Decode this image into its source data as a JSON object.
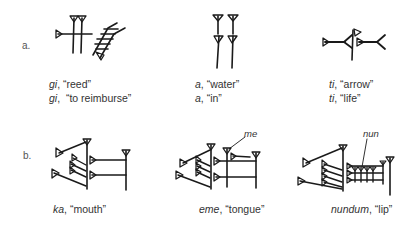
{
  "rows": [
    {
      "label": "a.",
      "signs": [
        {
          "glyph": "gi-sign",
          "captions": [
            {
              "translit": "gi",
              "sep": ", ",
              "gloss": "“reed”"
            },
            {
              "translit": "gi",
              "sep": ",  ",
              "gloss": "“to reimburse”"
            }
          ]
        },
        {
          "glyph": "a-sign",
          "captions": [
            {
              "translit": "a",
              "sep": ", ",
              "gloss": "“water”"
            },
            {
              "translit": "a",
              "sep": ", ",
              "gloss": "“in”"
            }
          ]
        },
        {
          "glyph": "ti-sign",
          "captions": [
            {
              "translit": "ti",
              "sep": ", ",
              "gloss": "“arrow”"
            },
            {
              "translit": "ti",
              "sep": ", ",
              "gloss": "“life”"
            }
          ]
        }
      ]
    },
    {
      "label": "b.",
      "signs": [
        {
          "glyph": "ka-sign",
          "captions": [
            {
              "translit": "ka",
              "sep": ", ",
              "gloss": "“mouth”"
            }
          ]
        },
        {
          "glyph": "eme-sign",
          "annotation": "me",
          "captions": [
            {
              "translit": "eme",
              "sep": ", ",
              "gloss": "“tongue”"
            }
          ]
        },
        {
          "glyph": "nundum-sign",
          "annotation": "nun",
          "captions": [
            {
              "translit": "nundum",
              "sep": ", ",
              "gloss": "“lip”"
            }
          ]
        }
      ]
    }
  ]
}
